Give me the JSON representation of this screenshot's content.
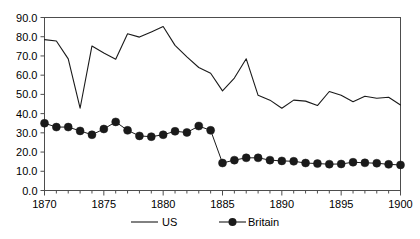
{
  "chart_data": {
    "type": "line",
    "title": "",
    "subtitle": "",
    "xlabel": "",
    "ylabel": "",
    "xlim": [
      1870,
      1900
    ],
    "ylim": [
      0.0,
      90.0
    ],
    "ytick_step": 10.0,
    "grid": false,
    "legend_position": "bottom",
    "x": [
      1870,
      1871,
      1872,
      1873,
      1874,
      1875,
      1876,
      1877,
      1878,
      1879,
      1880,
      1881,
      1882,
      1883,
      1884,
      1885,
      1886,
      1887,
      1888,
      1889,
      1890,
      1891,
      1892,
      1893,
      1894,
      1895,
      1896,
      1897,
      1898,
      1899,
      1900
    ],
    "xticks": [
      1870,
      1875,
      1880,
      1885,
      1890,
      1895,
      1900
    ],
    "xtick_labels": [
      "1870",
      "1875",
      "1880",
      "1885",
      "1890",
      "1895",
      "1900"
    ],
    "yticks": [
      0.0,
      10.0,
      20.0,
      30.0,
      40.0,
      50.0,
      60.0,
      70.0,
      80.0,
      90.0
    ],
    "ytick_labels": [
      "0.0",
      "10.0",
      "20.0",
      "30.0",
      "40.0",
      "50.0",
      "60.0",
      "70.0",
      "80.0",
      "90.0"
    ],
    "minor_xticks_per_interval": 5,
    "series": [
      {
        "name": "US",
        "marker": "none",
        "color": "#1a1a1a",
        "line_width": 1.1,
        "values": [
          78.5,
          77.8,
          68.5,
          42.8,
          75.2,
          71.5,
          68.3,
          81.5,
          79.8,
          82.5,
          85.3,
          75.5,
          69.5,
          64.0,
          61.0,
          51.8,
          58.5,
          68.5,
          49.5,
          47.0,
          42.8,
          47.0,
          46.5,
          44.2,
          51.5,
          49.5,
          46.2,
          49.0,
          48.0,
          48.5,
          44.5
        ]
      },
      {
        "name": "Britain",
        "marker": "filled-circle",
        "color": "#1a1a1a",
        "line_width": 1.0,
        "marker_size": 4.0,
        "values": [
          35.0,
          33.0,
          33.0,
          31.0,
          29.0,
          32.0,
          35.7,
          31.3,
          28.4,
          28.0,
          29.0,
          30.8,
          30.2,
          33.5,
          31.3,
          14.3,
          15.8,
          17.0,
          17.0,
          15.8,
          15.4,
          15.2,
          14.3,
          14.0,
          13.7,
          13.8,
          14.7,
          14.4,
          14.2,
          13.6,
          13.3
        ]
      }
    ]
  },
  "legend": {
    "items": [
      {
        "label": "US",
        "style": "line"
      },
      {
        "label": "Britain",
        "style": "line-marker"
      }
    ]
  },
  "colors": {
    "axis": "#4d4d4d",
    "series": "#1a1a1a",
    "background": "#ffffff"
  }
}
